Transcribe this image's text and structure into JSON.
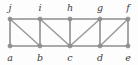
{
  "diagram": {
    "type": "graph",
    "background_color": "#fdfdfd",
    "edge_color": "#8f8f8f",
    "vertex_color": "#909090",
    "label_color": "#3b3b3b",
    "vertices": [
      {
        "id": "a",
        "label": "a",
        "x": 10,
        "y": 46,
        "row": "bottom",
        "label_x": 10,
        "label_y": 61
      },
      {
        "id": "b",
        "label": "b",
        "x": 40,
        "y": 46,
        "row": "bottom",
        "label_x": 40,
        "label_y": 61
      },
      {
        "id": "c",
        "label": "c",
        "x": 70,
        "y": 46,
        "row": "bottom",
        "label_x": 70,
        "label_y": 61
      },
      {
        "id": "d",
        "label": "d",
        "x": 100,
        "y": 46,
        "row": "bottom",
        "label_x": 100,
        "label_y": 61
      },
      {
        "id": "e",
        "label": "e",
        "x": 128,
        "y": 46,
        "row": "bottom",
        "label_x": 128,
        "label_y": 61
      },
      {
        "id": "f",
        "label": "f",
        "x": 128,
        "y": 19,
        "row": "top",
        "label_x": 128,
        "label_y": 11
      },
      {
        "id": "g",
        "label": "g",
        "x": 100,
        "y": 19,
        "row": "top",
        "label_x": 100,
        "label_y": 11
      },
      {
        "id": "h",
        "label": "h",
        "x": 70,
        "y": 19,
        "row": "top",
        "label_x": 70,
        "label_y": 11
      },
      {
        "id": "i",
        "label": "i",
        "x": 40,
        "y": 19,
        "row": "top",
        "label_x": 40,
        "label_y": 11
      },
      {
        "id": "j",
        "label": "j",
        "x": 10,
        "y": 19,
        "row": "top",
        "label_x": 10,
        "label_y": 11
      }
    ],
    "edges": [
      {
        "from": "a",
        "to": "b",
        "kind": "horizontal"
      },
      {
        "from": "b",
        "to": "c",
        "kind": "horizontal"
      },
      {
        "from": "c",
        "to": "d",
        "kind": "horizontal"
      },
      {
        "from": "d",
        "to": "e",
        "kind": "horizontal"
      },
      {
        "from": "j",
        "to": "i",
        "kind": "horizontal"
      },
      {
        "from": "i",
        "to": "h",
        "kind": "horizontal"
      },
      {
        "from": "h",
        "to": "g",
        "kind": "horizontal"
      },
      {
        "from": "g",
        "to": "f",
        "kind": "horizontal"
      },
      {
        "from": "a",
        "to": "j",
        "kind": "vertical"
      },
      {
        "from": "b",
        "to": "i",
        "kind": "vertical"
      },
      {
        "from": "c",
        "to": "h",
        "kind": "vertical"
      },
      {
        "from": "d",
        "to": "g",
        "kind": "vertical"
      },
      {
        "from": "e",
        "to": "f",
        "kind": "vertical"
      },
      {
        "from": "j",
        "to": "b",
        "kind": "diagonal"
      },
      {
        "from": "i",
        "to": "c",
        "kind": "diagonal"
      },
      {
        "from": "c",
        "to": "g",
        "kind": "diagonal"
      },
      {
        "from": "d",
        "to": "f",
        "kind": "diagonal"
      }
    ]
  }
}
